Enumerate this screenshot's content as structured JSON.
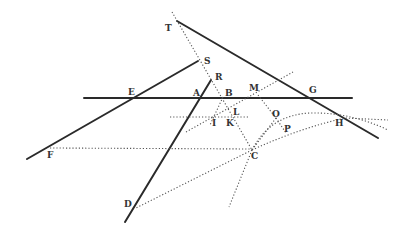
{
  "figure": {
    "type": "geometric construction",
    "points": [
      "T",
      "S",
      "R",
      "E",
      "A",
      "B",
      "M",
      "G",
      "L",
      "I",
      "K",
      "O",
      "P",
      "H",
      "F",
      "C",
      "D"
    ],
    "labels": {
      "T": "T",
      "S": "S",
      "R": "R",
      "E": "E",
      "A": "A",
      "B": "B",
      "M": "M",
      "G": "G",
      "L": "L",
      "I": "I",
      "K": "K",
      "O": "O",
      "P": "P",
      "H": "H",
      "F": "F",
      "C": "C",
      "D": "D"
    },
    "solid_lines": [
      "TG-H",
      "SF",
      "RD",
      "EAG"
    ],
    "dotted_lines": [
      "TSBLC",
      "FC",
      "IL",
      "CD",
      "BIK",
      "CM",
      "CO-H",
      "CP-H"
    ]
  }
}
